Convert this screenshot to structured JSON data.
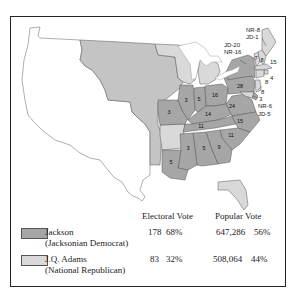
{
  "colors": {
    "jackson": "#a6a6a6",
    "adams": "#d9d9d9",
    "territory": "#c4c4c4",
    "border": "#555555"
  },
  "state_labels": {
    "me": "NR-8\nJD-1",
    "ny": "JD-20\nNR-16",
    "vt": "7",
    "nh": "8",
    "ma": "15",
    "ri": "4",
    "ct": "8",
    "nj": "8",
    "de": "3",
    "md": "NR-6\nJD-5",
    "pa": "28",
    "oh": "16",
    "in": "5",
    "il": "3",
    "mo": "3",
    "ky": "14",
    "va": "24",
    "tn": "11",
    "nc": "15",
    "sc": "11",
    "ga": "9",
    "al": "5",
    "ms": "3",
    "la": "5"
  },
  "legend": {
    "headers": {
      "electoral": "Electoral Vote",
      "popular": "Popular Vote"
    },
    "rows": [
      {
        "name": "Jackson",
        "party": "(Jacksonian Democrat)",
        "electoral_votes": "178",
        "electoral_pct": "68%",
        "popular_votes": "647,286",
        "popular_pct": "56%"
      },
      {
        "name": "J.Q. Adams",
        "party": "(National Republican)",
        "electoral_votes": "83",
        "electoral_pct": "32%",
        "popular_votes": "508,064",
        "popular_pct": "44%"
      }
    ]
  }
}
